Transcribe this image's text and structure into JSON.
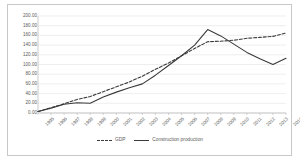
{
  "chart_data": {
    "type": "line",
    "title": "",
    "xlabel": "",
    "ylabel": "",
    "ylim": [
      0,
      200
    ],
    "ytick_step": 20,
    "grid": true,
    "grid_axis": "y",
    "legend_position": "bottom",
    "categories": [
      "1995",
      "1996",
      "1997",
      "1998",
      "1999",
      "2000",
      "2001",
      "2002",
      "2003",
      "2004",
      "2005",
      "2006",
      "2007",
      "2008",
      "2009",
      "2010",
      "2011",
      "2012",
      "2013",
      "2014"
    ],
    "yticks": [
      "0.00",
      "20.00",
      "40.00",
      "60.00",
      "80.00",
      "100.00",
      "120.00",
      "140.00",
      "160.00",
      "180.00",
      "200.00"
    ],
    "series": [
      {
        "name": "GDP",
        "style": "dashed",
        "color": "#3a3a3a",
        "values": [
          3,
          11,
          19,
          28,
          34,
          44,
          54,
          64,
          76,
          90,
          103,
          118,
          133,
          147,
          148,
          150,
          154,
          156,
          158,
          165
        ]
      },
      {
        "name": "Construction production",
        "style": "solid",
        "color": "#3a3a3a",
        "values": [
          3,
          10,
          18,
          21,
          20,
          33,
          43,
          52,
          60,
          78,
          98,
          118,
          140,
          172,
          159,
          142,
          125,
          112,
          100,
          113
        ]
      }
    ]
  },
  "legend": {
    "items": [
      {
        "label": "GDP",
        "style": "dashed"
      },
      {
        "label": "Construction production",
        "style": "solid"
      }
    ]
  }
}
